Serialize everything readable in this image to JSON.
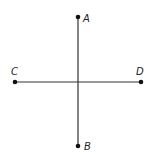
{
  "diagram": {
    "points": [
      {
        "id": "A",
        "label": "A"
      },
      {
        "id": "B",
        "label": "B"
      },
      {
        "id": "C",
        "label": "C"
      },
      {
        "id": "D",
        "label": "D"
      }
    ],
    "segments": [
      {
        "id": "AB",
        "from": "A",
        "to": "B"
      },
      {
        "id": "CD",
        "from": "C",
        "to": "D"
      }
    ],
    "colors": {
      "line": "#333333",
      "point": "#111111",
      "label": "#222222"
    }
  }
}
